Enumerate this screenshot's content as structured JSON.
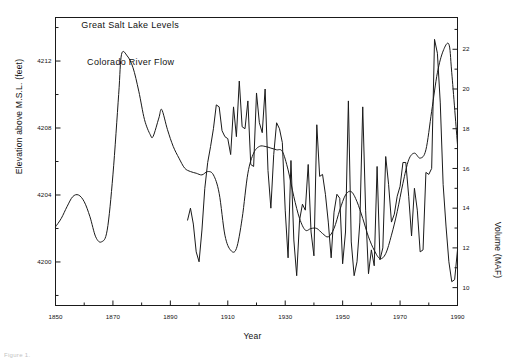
{
  "figure": {
    "caption_fragment": "Figure 1.",
    "background": "#ffffff",
    "line_color": "#1a1a1a"
  },
  "axes": {
    "x": {
      "label": "Year",
      "min": 1850,
      "max": 1990,
      "major_ticks": [
        1850,
        1870,
        1890,
        1910,
        1930,
        1950,
        1970,
        1990
      ],
      "major_tick_labels": [
        "1850",
        "1870",
        "1890",
        "1910",
        "1930",
        "1950",
        "1970",
        "1990"
      ],
      "minor_tick_step": 10
    },
    "y_left": {
      "label": "Elevation above M.S.L. (feet)",
      "min": 4197.4,
      "max": 4214.6,
      "ticks": [
        4200,
        4204,
        4208,
        4212
      ],
      "tick_labels": [
        "4200",
        "4204",
        "4208",
        "4212"
      ]
    },
    "y_right": {
      "label": "Volume (MAF)",
      "min": 9.1,
      "max": 23.6,
      "ticks": [
        10,
        12,
        14,
        16,
        18,
        20,
        22
      ],
      "tick_labels": [
        "10",
        "12",
        "14",
        "16",
        "18",
        "20",
        "22"
      ]
    }
  },
  "chart_data": {
    "type": "line",
    "title": "",
    "xlabel": "Year",
    "ylabel": "Elevation above M.S.L. (feet)",
    "ylabel_secondary": "Volume (MAF)",
    "xlim": [
      1850,
      1990
    ],
    "ylim": [
      4197.4,
      4214.6
    ],
    "ylim_secondary": [
      9.1,
      23.6
    ],
    "grid": false,
    "legend": "inline-annotation",
    "series": [
      {
        "name": "Great Salt Lake Levels",
        "axis": "y_left",
        "units": "feet above M.S.L.",
        "annotation_position": {
          "x": 1859,
          "y": 4214.0
        },
        "x": [
          1850,
          1852,
          1854,
          1856,
          1858,
          1860,
          1862,
          1864,
          1866,
          1868,
          1870,
          1872,
          1873,
          1875,
          1877,
          1879,
          1881,
          1883,
          1884,
          1886,
          1887,
          1889,
          1891,
          1893,
          1895,
          1897,
          1899,
          1901,
          1903,
          1905,
          1907,
          1909,
          1911,
          1913,
          1915,
          1917,
          1919,
          1921,
          1923,
          1925,
          1927,
          1929,
          1931,
          1933,
          1935,
          1937,
          1939,
          1941,
          1943,
          1945,
          1947,
          1949,
          1951,
          1953,
          1955,
          1957,
          1959,
          1961,
          1963,
          1965,
          1967,
          1969,
          1971,
          1973,
          1975,
          1977,
          1979,
          1981,
          1983,
          1985,
          1987,
          1988,
          1990
        ],
        "y": [
          4202.1,
          4202.6,
          4203.3,
          4203.9,
          4204.0,
          4203.6,
          4202.7,
          4201.5,
          4201.2,
          4201.9,
          4205.2,
          4210.0,
          4212.4,
          4212.3,
          4211.6,
          4210.2,
          4208.5,
          4207.6,
          4207.5,
          4208.6,
          4209.1,
          4207.9,
          4206.9,
          4206.2,
          4205.6,
          4205.4,
          4205.3,
          4205.2,
          4205.4,
          4205.2,
          4204.1,
          4201.6,
          4200.7,
          4200.8,
          4202.6,
          4205.3,
          4206.5,
          4206.9,
          4206.9,
          4206.8,
          4206.7,
          4206.6,
          4205.5,
          4203.9,
          4202.6,
          4201.9,
          4202.0,
          4202.0,
          4201.7,
          4201.5,
          4202.0,
          4203.1,
          4204.0,
          4204.2,
          4203.6,
          4202.6,
          4201.5,
          4200.7,
          4200.2,
          4200.5,
          4201.6,
          4203.0,
          4204.7,
          4206.1,
          4206.5,
          4206.2,
          4206.7,
          4209.0,
          4211.3,
          4212.6,
          4213.0,
          4211.3,
          4207.0
        ]
      },
      {
        "name": "Colorado River Flow",
        "axis": "y_right",
        "units": "MAF",
        "annotation_position": {
          "x": 1861,
          "y": 21.2
        },
        "x": [
          1896,
          1897,
          1898,
          1899,
          1900,
          1901,
          1902,
          1903,
          1904,
          1905,
          1906,
          1907,
          1908,
          1909,
          1910,
          1911,
          1912,
          1913,
          1914,
          1915,
          1916,
          1917,
          1918,
          1919,
          1920,
          1921,
          1922,
          1923,
          1924,
          1925,
          1926,
          1927,
          1928,
          1929,
          1930,
          1931,
          1932,
          1933,
          1934,
          1935,
          1936,
          1937,
          1938,
          1939,
          1940,
          1941,
          1942,
          1943,
          1944,
          1945,
          1946,
          1947,
          1948,
          1949,
          1950,
          1951,
          1952,
          1953,
          1954,
          1955,
          1956,
          1957,
          1958,
          1959,
          1960,
          1961,
          1962,
          1963,
          1964,
          1965,
          1966,
          1967,
          1968,
          1969,
          1970,
          1971,
          1972,
          1973,
          1974,
          1975,
          1976,
          1977,
          1978,
          1979,
          1980,
          1981,
          1982,
          1983,
          1984,
          1985,
          1986,
          1987,
          1988,
          1989,
          1990
        ],
        "y": [
          13.4,
          14.0,
          13.2,
          11.8,
          11.3,
          12.9,
          15.0,
          16.3,
          17.1,
          18.0,
          19.2,
          19.1,
          17.9,
          17.6,
          17.5,
          16.7,
          19.1,
          17.6,
          20.4,
          18.1,
          18.0,
          19.4,
          16.2,
          16.1,
          19.8,
          18.3,
          17.8,
          20.0,
          15.9,
          14.0,
          16.7,
          18.3,
          18.0,
          17.3,
          13.9,
          11.5,
          16.4,
          12.4,
          10.6,
          13.4,
          14.2,
          13.9,
          16.2,
          12.8,
          11.6,
          18.2,
          15.6,
          15.7,
          14.7,
          13.3,
          11.5,
          13.8,
          14.7,
          14.5,
          11.2,
          12.8,
          19.4,
          12.3,
          10.6,
          11.3,
          13.3,
          19.1,
          13.9,
          10.7,
          11.9,
          11.1,
          16.1,
          11.4,
          12.0,
          16.6,
          15.2,
          13.3,
          13.7,
          14.6,
          15.1,
          16.3,
          16.3,
          14.6,
          12.6,
          15.0,
          13.9,
          11.8,
          11.9,
          15.8,
          15.7,
          16.0,
          22.5,
          21.8,
          19.3,
          15.2,
          13.1,
          11.3,
          10.3,
          10.4,
          11.9
        ]
      }
    ]
  }
}
